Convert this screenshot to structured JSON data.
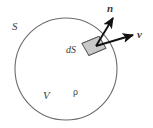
{
  "figure": {
    "type": "vector-calculus-diagram",
    "background_color": "#ffffff",
    "outline_color": "#6b6b6b",
    "patch_fill_color": "#c9c9c9",
    "patch_edge_color": "#4a4a4a",
    "arrow_color": "#111111",
    "label_color": "#3b3b3b",
    "labels": {
      "surface": "S",
      "volume": "V",
      "density": "ρ",
      "surface_element": "dS",
      "normal_vector": "n",
      "velocity_vector": "v"
    },
    "geometry": {
      "circle": {
        "cx": 66,
        "cy": 69,
        "r": 51
      },
      "patch": {
        "cx": 94,
        "cy": 46,
        "width": 18,
        "height": 15,
        "rotation_deg": -28
      },
      "normal_arrow": {
        "x1": 96,
        "y1": 46,
        "x2": 114,
        "y2": 17
      },
      "velocity_arrow": {
        "x1": 96,
        "y1": 46,
        "x2": 134,
        "y2": 35
      }
    }
  }
}
